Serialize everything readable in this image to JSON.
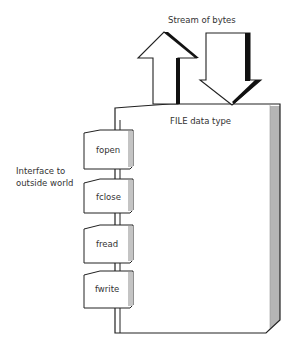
{
  "diagram": {
    "stream_label": "Stream of bytes",
    "file_label": "FILE data type",
    "interface_label_line1": "Interface to",
    "interface_label_line2": "outside world",
    "functions": [
      {
        "label": "fopen"
      },
      {
        "label": "fclose"
      },
      {
        "label": "fread"
      },
      {
        "label": "fwrite"
      }
    ],
    "colors": {
      "stroke": "#222222",
      "shadow": "#111111",
      "side_shade": "#b5b5b5",
      "box_fill": "#ffffff"
    }
  }
}
